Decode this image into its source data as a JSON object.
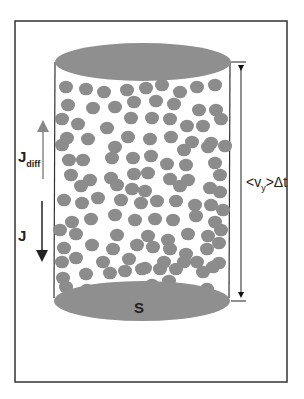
{
  "diagram": {
    "labels": {
      "j_diff": "J",
      "j_diff_sub": "diff",
      "j": "J",
      "surface": "S",
      "height_prefix": "<v",
      "height_sub": "y",
      "height_suffix": ">Δt"
    },
    "colors": {
      "particle": "#8c8c8c",
      "ellipse": "#8f8f8f",
      "frame": "#333333",
      "jdiff_arrow": "#888888",
      "j_arrow": "#222222"
    },
    "particles": [
      [
        66,
        87
      ],
      [
        86,
        89
      ],
      [
        104,
        92
      ],
      [
        127,
        90
      ],
      [
        146,
        88
      ],
      [
        162,
        85
      ],
      [
        180,
        92
      ],
      [
        197,
        87
      ],
      [
        215,
        85
      ],
      [
        68,
        105
      ],
      [
        93,
        108
      ],
      [
        115,
        107
      ],
      [
        134,
        102
      ],
      [
        156,
        101
      ],
      [
        174,
        104
      ],
      [
        199,
        110
      ],
      [
        216,
        110
      ],
      [
        62,
        119
      ],
      [
        78,
        124
      ],
      [
        107,
        128
      ],
      [
        131,
        118
      ],
      [
        152,
        118
      ],
      [
        170,
        119
      ],
      [
        187,
        126
      ],
      [
        203,
        126
      ],
      [
        221,
        119
      ],
      [
        67,
        138
      ],
      [
        88,
        139
      ],
      [
        128,
        137
      ],
      [
        150,
        139
      ],
      [
        171,
        137
      ],
      [
        192,
        142
      ],
      [
        211,
        143
      ],
      [
        62,
        145
      ],
      [
        115,
        147
      ],
      [
        184,
        150
      ],
      [
        208,
        147
      ],
      [
        225,
        146
      ],
      [
        69,
        160
      ],
      [
        83,
        160
      ],
      [
        112,
        158
      ],
      [
        133,
        158
      ],
      [
        151,
        156
      ],
      [
        167,
        164
      ],
      [
        186,
        165
      ],
      [
        215,
        163
      ],
      [
        71,
        175
      ],
      [
        90,
        180
      ],
      [
        111,
        178
      ],
      [
        134,
        174
      ],
      [
        148,
        173
      ],
      [
        170,
        179
      ],
      [
        188,
        180
      ],
      [
        220,
        175
      ],
      [
        81,
        186
      ],
      [
        117,
        185
      ],
      [
        132,
        189
      ],
      [
        145,
        191
      ],
      [
        180,
        186
      ],
      [
        210,
        188
      ],
      [
        220,
        192
      ],
      [
        64,
        200
      ],
      [
        82,
        203
      ],
      [
        98,
        198
      ],
      [
        121,
        200
      ],
      [
        141,
        203
      ],
      [
        157,
        201
      ],
      [
        176,
        201
      ],
      [
        195,
        205
      ],
      [
        211,
        205
      ],
      [
        223,
        210
      ],
      [
        72,
        222
      ],
      [
        91,
        219
      ],
      [
        115,
        215
      ],
      [
        135,
        220
      ],
      [
        155,
        219
      ],
      [
        173,
        220
      ],
      [
        196,
        216
      ],
      [
        215,
        222
      ],
      [
        60,
        230
      ],
      [
        76,
        234
      ],
      [
        117,
        235
      ],
      [
        148,
        236
      ],
      [
        168,
        240
      ],
      [
        188,
        234
      ],
      [
        208,
        236
      ],
      [
        221,
        230
      ],
      [
        64,
        248
      ],
      [
        92,
        245
      ],
      [
        113,
        249
      ],
      [
        137,
        245
      ],
      [
        153,
        247
      ],
      [
        170,
        249
      ],
      [
        186,
        254
      ],
      [
        207,
        249
      ],
      [
        219,
        243
      ],
      [
        62,
        262
      ],
      [
        76,
        258
      ],
      [
        103,
        262
      ],
      [
        129,
        259
      ],
      [
        145,
        268
      ],
      [
        164,
        262
      ],
      [
        184,
        262
      ],
      [
        197,
        262
      ],
      [
        219,
        263
      ],
      [
        63,
        278
      ],
      [
        86,
        274
      ],
      [
        110,
        273
      ],
      [
        125,
        271
      ],
      [
        142,
        269
      ],
      [
        160,
        269
      ],
      [
        176,
        269
      ],
      [
        203,
        272
      ],
      [
        213,
        267
      ],
      [
        66,
        287
      ],
      [
        87,
        290
      ],
      [
        113,
        289
      ],
      [
        131,
        291
      ],
      [
        152,
        285
      ],
      [
        169,
        281
      ],
      [
        182,
        290
      ],
      [
        207,
        289
      ]
    ]
  }
}
